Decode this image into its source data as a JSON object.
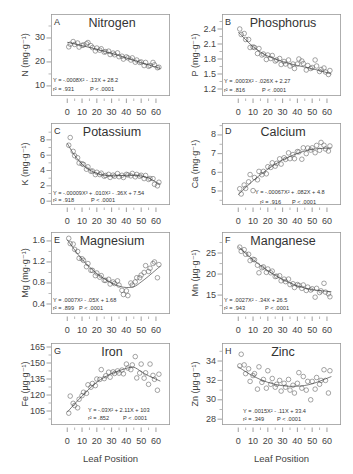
{
  "figure": {
    "xlabel": "Leaf Position"
  },
  "chart_data": [
    {
      "type": "scatter",
      "panel": "A",
      "title": "Nitrogen",
      "ylabel": "N (mg·g⁻¹)",
      "xlabel": "Leaf Position",
      "xlim": [
        -11,
        69.5
      ],
      "ylim": [
        5.8,
        40
      ],
      "xticks": [
        0,
        10,
        20,
        30,
        40,
        50,
        60
      ],
      "yticks": [
        10,
        20,
        30
      ],
      "grid": false,
      "equation": "Y = -.0008X² - .13X + 28.2",
      "r2": "r² = .931",
      "p": "P < .0001",
      "x": [
        1,
        2,
        4,
        5,
        7,
        8,
        10,
        11,
        13,
        14,
        16,
        17,
        19,
        20,
        22,
        23,
        25,
        26,
        28,
        29,
        31,
        32,
        34,
        35,
        37,
        38,
        40,
        41,
        43,
        44,
        46,
        47,
        49,
        50,
        52,
        53,
        55,
        56,
        58,
        59,
        61,
        62
      ],
      "y": [
        26.3,
        27.4,
        28.5,
        27.3,
        27.9,
        26.2,
        26.9,
        27.1,
        27.6,
        28.1,
        26.8,
        26.0,
        24.6,
        25.8,
        24.9,
        25.5,
        24.1,
        24.3,
        24.5,
        23.1,
        23.7,
        23.0,
        23.8,
        22.2,
        22.4,
        21.2,
        22.1,
        21.7,
        20.8,
        21.7,
        19.9,
        20.8,
        19.8,
        20.0,
        18.5,
        19.8,
        18.2,
        18.5,
        19.8,
        18.8,
        17.6,
        17.8
      ],
      "trend": [
        [
          0,
          28.2
        ],
        [
          8,
          27.1
        ],
        [
          16,
          25.9
        ],
        [
          24,
          24.6
        ],
        [
          32,
          23.2
        ],
        [
          40,
          21.7
        ],
        [
          48,
          20.1
        ],
        [
          56,
          18.6
        ],
        [
          63,
          17.3
        ]
      ]
    },
    {
      "type": "scatter",
      "panel": "B",
      "title": "Phosphorus",
      "ylabel": "P (mg·g⁻¹)",
      "xlabel": "Leaf Position",
      "xlim": [
        -11,
        69.5
      ],
      "ylim": [
        1.06,
        2.7
      ],
      "xticks": [
        0,
        10,
        20,
        30,
        40,
        50,
        60
      ],
      "yticks": [
        1.2,
        1.5,
        1.8,
        2.1,
        2.4
      ],
      "grid": false,
      "equation": "Y = .0003X² - .026X + 2.27",
      "r2": "r² = .816",
      "p": "P < .0001",
      "x": [
        1,
        2,
        4,
        5,
        7,
        8,
        10,
        11,
        13,
        14,
        16,
        17,
        19,
        20,
        22,
        23,
        25,
        26,
        28,
        29,
        31,
        32,
        34,
        35,
        37,
        38,
        40,
        41,
        43,
        44,
        46,
        47,
        49,
        50,
        52,
        53,
        55,
        56,
        58,
        59,
        61,
        62
      ],
      "y": [
        2.4,
        2.29,
        2.31,
        2.19,
        2.19,
        2.03,
        2.04,
        2.03,
        1.91,
        2.01,
        1.88,
        1.9,
        1.79,
        1.88,
        1.81,
        1.87,
        1.76,
        1.78,
        1.81,
        1.69,
        1.75,
        1.7,
        1.78,
        1.66,
        1.7,
        1.61,
        1.7,
        1.8,
        1.76,
        1.71,
        1.58,
        1.67,
        1.61,
        1.63,
        1.78,
        1.66,
        1.55,
        1.59,
        1.62,
        1.54,
        1.49,
        1.57
      ],
      "trend": [
        [
          0,
          2.34
        ],
        [
          8,
          2.1
        ],
        [
          16,
          1.92
        ],
        [
          24,
          1.81
        ],
        [
          32,
          1.73
        ],
        [
          40,
          1.67
        ],
        [
          48,
          1.62
        ],
        [
          56,
          1.56
        ],
        [
          63,
          1.5
        ]
      ]
    },
    {
      "type": "scatter",
      "panel": "C",
      "title": "Potassium",
      "ylabel": "K (mg·g⁻¹)",
      "xlabel": "Leaf Position",
      "xlim": [
        -11,
        69.5
      ],
      "ylim": [
        -0.5,
        10.2
      ],
      "xticks": [
        0,
        10,
        20,
        30,
        40,
        50,
        60
      ],
      "yticks": [
        0,
        2,
        4,
        6,
        8
      ],
      "grid": false,
      "equation": "Y = -.00009X³ + .010X² - .36X + 7.54",
      "r2": "r² = .918",
      "p": "P < .0001",
      "x": [
        1,
        2,
        4,
        5,
        7,
        8,
        10,
        11,
        13,
        14,
        16,
        17,
        19,
        20,
        22,
        23,
        25,
        26,
        28,
        29,
        31,
        32,
        34,
        35,
        37,
        38,
        40,
        41,
        43,
        44,
        46,
        47,
        49,
        50,
        52,
        53,
        55,
        56,
        58,
        59,
        61,
        62
      ],
      "y": [
        7.3,
        8.3,
        6.5,
        5.93,
        5.66,
        4.98,
        4.88,
        4.79,
        4.17,
        4.48,
        3.9,
        3.94,
        3.47,
        3.77,
        3.47,
        3.65,
        3.26,
        3.35,
        3.5,
        3.1,
        3.4,
        3.25,
        3.6,
        3.19,
        3.38,
        3.09,
        3.5,
        3.43,
        3.3,
        3.62,
        3.18,
        3.49,
        3.25,
        3.38,
        2.95,
        3.35,
        2.84,
        2.96,
        2.94,
        2.2,
        2.0,
        2.47
      ],
      "trend": [
        [
          0,
          7.54
        ],
        [
          4,
          6.25
        ],
        [
          8,
          5.25
        ],
        [
          12,
          4.5
        ],
        [
          16,
          3.97
        ],
        [
          20,
          3.62
        ],
        [
          25,
          3.38
        ],
        [
          30,
          3.31
        ],
        [
          35,
          3.34
        ],
        [
          40,
          3.38
        ],
        [
          45,
          3.38
        ],
        [
          50,
          3.29
        ],
        [
          55,
          3.02
        ],
        [
          60,
          2.5
        ],
        [
          63,
          2.2
        ]
      ]
    },
    {
      "type": "scatter",
      "panel": "D",
      "title": "Calcium",
      "ylabel": "Ca (mg·g⁻¹)",
      "xlabel": "Leaf Position",
      "xlim": [
        -11,
        69.5
      ],
      "ylim": [
        4.25,
        8.64
      ],
      "xticks": [
        0,
        10,
        20,
        30,
        40,
        50,
        60
      ],
      "yticks": [
        5,
        6,
        7,
        8
      ],
      "grid": false,
      "equation": "Y = -.00067X² + .082X + 4.8",
      "r2": "r² = .916",
      "p": "P < .0001",
      "x": [
        1,
        2,
        4,
        5,
        7,
        8,
        10,
        11,
        13,
        14,
        16,
        17,
        19,
        20,
        22,
        23,
        25,
        26,
        28,
        29,
        31,
        32,
        34,
        35,
        37,
        38,
        40,
        41,
        43,
        44,
        46,
        47,
        49,
        50,
        52,
        53,
        55,
        56,
        58,
        59,
        61,
        62
      ],
      "y": [
        5.12,
        4.84,
        5.32,
        5.14,
        5.49,
        5.88,
        5.02,
        5.72,
        5.6,
        6.05,
        5.87,
        6.05,
        5.92,
        6.3,
        6.26,
        6.51,
        6.33,
        6.48,
        6.72,
        6.44,
        6.78,
        6.69,
        7.04,
        6.73,
        6.95,
        6.73,
        7.11,
        7.09,
        6.7,
        7.31,
        7.0,
        7.3,
        7.19,
        7.31,
        7.05,
        7.44,
        7.18,
        7.6,
        7.45,
        7.25,
        7.14,
        7.41
      ],
      "trend": [
        [
          0,
          4.8
        ],
        [
          10,
          5.55
        ],
        [
          20,
          6.17
        ],
        [
          30,
          6.66
        ],
        [
          40,
          7.01
        ],
        [
          50,
          7.23
        ],
        [
          63,
          7.3
        ]
      ]
    },
    {
      "type": "scatter",
      "panel": "E",
      "title": "Magnesium",
      "ylabel": "Mg (mg·g⁻¹)",
      "xlabel": "Leaf Position",
      "xlim": [
        -11,
        69.5
      ],
      "ylim": [
        0.21,
        1.77
      ],
      "xticks": [
        0,
        10,
        20,
        30,
        40,
        50,
        60
      ],
      "yticks": [
        0.4,
        0.8,
        1.2,
        1.6
      ],
      "grid": false,
      "equation": "Y = .0007X² - .05X + 1.68",
      "r2": "r² = .899",
      "p": "P < .0001",
      "x": [
        1,
        2,
        4,
        5,
        7,
        8,
        10,
        11,
        13,
        14,
        16,
        17,
        19,
        20,
        22,
        23,
        25,
        26,
        28,
        29,
        31,
        32,
        34,
        35,
        37,
        38,
        40,
        41,
        43,
        44,
        46,
        47,
        49,
        50,
        52,
        53,
        55,
        56,
        58,
        59,
        61,
        62
      ],
      "y": [
        1.65,
        1.55,
        1.54,
        1.44,
        1.4,
        1.27,
        1.26,
        1.23,
        1.11,
        1.17,
        1.04,
        1.04,
        0.94,
        0.99,
        0.91,
        0.94,
        0.85,
        0.85,
        0.87,
        0.78,
        0.82,
        0.79,
        0.84,
        0.76,
        0.66,
        0.58,
        0.65,
        0.56,
        0.8,
        0.76,
        0.82,
        0.9,
        0.9,
        0.95,
        1.0,
        1.13,
        1.02,
        1.08,
        1.17,
        1.2,
        0.9,
        1.15
      ],
      "trend": [
        [
          0,
          1.62
        ],
        [
          10,
          1.25
        ],
        [
          20,
          0.98
        ],
        [
          30,
          0.8
        ],
        [
          38,
          0.72
        ],
        [
          45,
          0.73
        ],
        [
          50,
          0.82
        ],
        [
          55,
          0.93
        ],
        [
          60,
          1.05
        ],
        [
          63,
          1.12
        ]
      ]
    },
    {
      "type": "scatter",
      "panel": "F",
      "title": "Manganese",
      "ylabel": "Mn (µg·g⁻¹)",
      "xlabel": "Leaf Position",
      "xlim": [
        -11,
        69.5
      ],
      "ylim": [
        10.5,
        30
      ],
      "xticks": [
        0,
        10,
        20,
        30,
        40,
        50,
        60
      ],
      "yticks": [
        15,
        20,
        25
      ],
      "grid": false,
      "equation": "Y = .0027X² - .34X + 26.5",
      "r2": "r² = .943",
      "p": "P < .0001",
      "x": [
        1,
        2,
        4,
        5,
        7,
        8,
        10,
        11,
        13,
        14,
        16,
        17,
        19,
        20,
        22,
        23,
        25,
        26,
        28,
        29,
        31,
        32,
        34,
        35,
        37,
        38,
        40,
        41,
        43,
        44,
        46,
        47,
        49,
        50,
        52,
        53,
        55,
        56,
        58,
        59,
        61,
        62
      ],
      "y": [
        26.4,
        25.4,
        25.8,
        24.7,
        24.7,
        23.2,
        23.5,
        23.4,
        22.1,
        20.3,
        21.5,
        21.7,
        20.4,
        21.2,
        20.3,
        20.7,
        19.4,
        19.5,
        19.6,
        18.4,
        18.8,
        18.2,
        18.8,
        17.5,
        17.7,
        16.8,
        17.5,
        17.3,
        16.6,
        17.4,
        16.1,
        16.9,
        16.2,
        16.5,
        14.5,
        16.6,
        15.6,
        16.0,
        17.8,
        15.7,
        15.3,
        14.6
      ],
      "trend": [
        [
          0,
          26.5
        ],
        [
          10,
          23.4
        ],
        [
          20,
          20.8
        ],
        [
          30,
          18.7
        ],
        [
          40,
          17.2
        ],
        [
          50,
          16.3
        ],
        [
          63,
          15.8
        ]
      ]
    },
    {
      "type": "scatter",
      "panel": "G",
      "title": "Iron",
      "ylabel": "Fe (µg·g⁻¹)",
      "xlabel": "Leaf Position",
      "xlim": [
        -11,
        69.5
      ],
      "ylim": [
        91.9,
        168.75
      ],
      "xticks": [
        0,
        10,
        20,
        30,
        40,
        50,
        60
      ],
      "yticks": [
        105,
        120,
        135,
        150,
        165
      ],
      "grid": false,
      "equation": "Y = -.03X² + 2.11X + 103",
      "r2": "r² = .852",
      "p": "P < .0001",
      "x": [
        1,
        2,
        4,
        5,
        7,
        8,
        10,
        11,
        13,
        14,
        16,
        17,
        19,
        20,
        22,
        23,
        25,
        26,
        28,
        29,
        31,
        32,
        34,
        35,
        37,
        38,
        40,
        41,
        43,
        44,
        46,
        47,
        49,
        50,
        52,
        53,
        55,
        56,
        58,
        59,
        61,
        62
      ],
      "y": [
        103,
        119,
        112.2,
        110.2,
        108,
        116,
        119.4,
        122.6,
        121.6,
        129.6,
        127.3,
        130.8,
        128.8,
        135,
        134.6,
        143.8,
        135.4,
        138,
        141.4,
        136.7,
        141.7,
        140.2,
        142.6,
        140.5,
        143.4,
        139.9,
        149,
        145.3,
        143.8,
        148.2,
        156,
        136,
        140.6,
        149,
        135.8,
        140.8,
        130,
        149,
        138.4,
        134.7,
        124.5,
        139.5
      ],
      "trend": [
        [
          0,
          104
        ],
        [
          10,
          119
        ],
        [
          20,
          132
        ],
        [
          30,
          140
        ],
        [
          40,
          145
        ],
        [
          45,
          146
        ],
        [
          50,
          142
        ],
        [
          55,
          138
        ],
        [
          63,
          133
        ]
      ]
    },
    {
      "type": "scatter",
      "panel": "H",
      "title": "Zinc",
      "ylabel": "Zn (µg·g⁻¹)",
      "xlabel": "Leaf Position",
      "xlim": [
        -11,
        69.5
      ],
      "ylim": [
        27.4,
        35.86
      ],
      "xticks": [
        0,
        10,
        20,
        30,
        40,
        50,
        60
      ],
      "yticks": [
        28,
        30,
        32,
        34
      ],
      "grid": false,
      "equation": "Y = .0015X² - .11X + 33.4",
      "r2": "r² = .349",
      "p": "P < .0001",
      "x": [
        1,
        2,
        4,
        5,
        7,
        8,
        10,
        11,
        13,
        14,
        16,
        17,
        19,
        20,
        22,
        23,
        25,
        26,
        28,
        29,
        31,
        32,
        34,
        35,
        37,
        38,
        40,
        41,
        43,
        44,
        46,
        47,
        49,
        50,
        52,
        53,
        55,
        56,
        58,
        59,
        61,
        62
      ],
      "y": [
        33.5,
        34.7,
        33.6,
        32.7,
        33.2,
        31.9,
        32.5,
        32.7,
        31.1,
        33.4,
        31.8,
        32.1,
        31.2,
        33.0,
        31.6,
        32.2,
        31.3,
        31.6,
        32.0,
        30.9,
        31.7,
        31.3,
        32.1,
        31.0,
        31.5,
        30.7,
        31.7,
        32.8,
        31.2,
        32.4,
        31.0,
        31.9,
        30.0,
        31.9,
        31.1,
        32.3,
        31.6,
        32.0,
        33.1,
        32.0,
        30.7,
        33.0
      ],
      "trend": [
        [
          0,
          33.4
        ],
        [
          10,
          32.45
        ],
        [
          20,
          31.8
        ],
        [
          30,
          31.45
        ],
        [
          40,
          31.4
        ],
        [
          50,
          31.65
        ],
        [
          63,
          32.4
        ]
      ]
    }
  ]
}
